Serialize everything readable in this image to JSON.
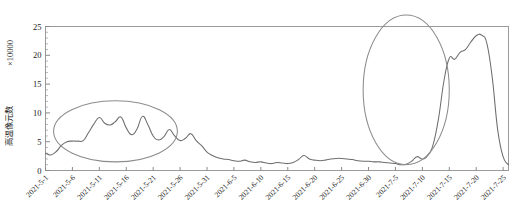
{
  "chart_data": {
    "type": "line",
    "title": "",
    "xlabel": "",
    "ylabel": "高温像元数",
    "y_unit_label": "×10000",
    "ylim": [
      0,
      25
    ],
    "yticks": [
      0,
      5,
      10,
      15,
      20,
      25
    ],
    "ytick_labels": [
      "0",
      "5",
      "10",
      "15",
      "20",
      "25"
    ],
    "y_minor_tick_step": 1,
    "grid": false,
    "legend": null,
    "x_tick_labels": [
      "2021-5-1",
      "2021-5-6",
      "2021-5-11",
      "2021-5-16",
      "2021-5-21",
      "2021-5-26",
      "2021-5-31",
      "2021-6-5",
      "2021-6-10",
      "2021-6-15",
      "2021-6-20",
      "2021-6-25",
      "2021-6-30",
      "2021-7-5",
      "2021-7-10",
      "2021-7-15",
      "2021-7-20",
      "2021-7-25"
    ],
    "x_tick_label_rotation_deg": 45,
    "x_start_date": "2021-5-1",
    "x_end_date": "2021-7-26",
    "x_tick_interval_days": 5,
    "series": [
      {
        "name": "高温像元数",
        "color": "#6e6e6e",
        "x": [
          0,
          1,
          2,
          3,
          4,
          5,
          6,
          7,
          8,
          9,
          10,
          11,
          12,
          13,
          14,
          15,
          16,
          17,
          18,
          19,
          20,
          21,
          22,
          23,
          24,
          25,
          26,
          27,
          28,
          29,
          30,
          31,
          32,
          33,
          34,
          35,
          36,
          37,
          38,
          39,
          40,
          41,
          42,
          43,
          44,
          45,
          46,
          47,
          48,
          49,
          50,
          51,
          52,
          53,
          54,
          55,
          56,
          57,
          58,
          59,
          60,
          61,
          62,
          63,
          64,
          65,
          66,
          67,
          68,
          69,
          70,
          71,
          72,
          73,
          74,
          75,
          76,
          77,
          78,
          79,
          80,
          81,
          82,
          83,
          84,
          85,
          86
        ],
        "values": [
          3.0,
          2.7,
          3.3,
          4.4,
          5.0,
          5.1,
          5.1,
          5.2,
          6.6,
          8.1,
          9.2,
          8.2,
          7.9,
          8.5,
          9.3,
          7.4,
          6.2,
          7.2,
          9.4,
          8.0,
          6.0,
          5.3,
          5.9,
          7.1,
          6.0,
          5.2,
          5.6,
          6.4,
          5.2,
          4.3,
          3.2,
          2.6,
          2.2,
          2.0,
          1.9,
          1.7,
          1.6,
          1.8,
          1.5,
          1.4,
          1.5,
          1.3,
          1.2,
          1.4,
          1.3,
          1.2,
          1.4,
          1.9,
          2.6,
          2.0,
          1.8,
          1.7,
          1.8,
          2.0,
          2.1,
          2.1,
          2.0,
          1.9,
          1.7,
          1.6,
          1.6,
          1.5,
          1.5,
          1.4,
          1.3,
          1.2,
          1.0,
          1.1,
          1.6,
          2.4,
          2.0,
          2.6,
          4.5,
          9.0,
          15.5,
          19.5,
          19.3,
          20.5,
          21.0,
          22.3,
          23.4,
          23.5,
          22.0,
          16.0,
          7.0,
          2.4,
          1.0
        ]
      }
    ],
    "annotations": [
      {
        "type": "ellipse",
        "name": "episode-1-highlight",
        "center_x_date": "2021-5-14",
        "center_y": 6.8,
        "rx_days": 11.5,
        "ry": 5.3,
        "color": "#8c8c8c"
      },
      {
        "type": "ellipse",
        "name": "episode-2-highlight",
        "center_x_date": "2021-7-7",
        "center_y": 14.0,
        "rx_days": 8.0,
        "ry": 13.0,
        "color": "#8c8c8c"
      }
    ]
  }
}
